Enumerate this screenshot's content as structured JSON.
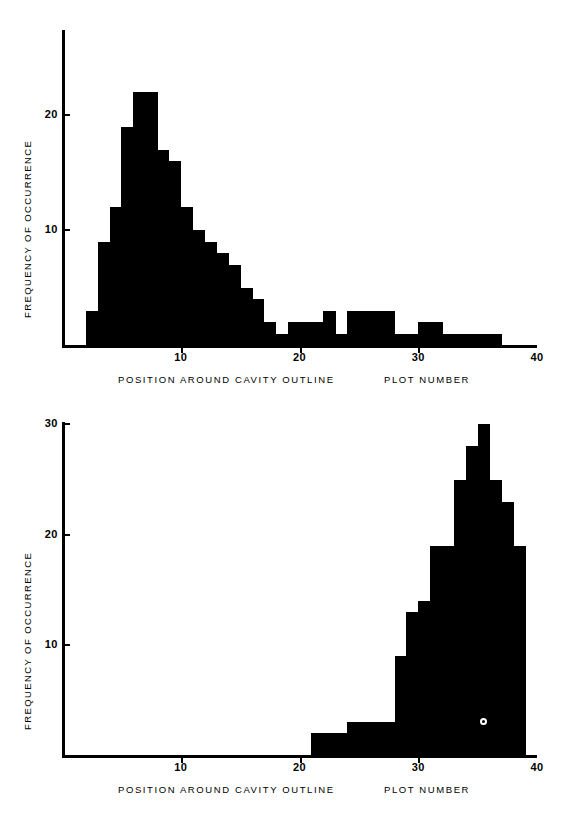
{
  "figure": {
    "background": "#ffffff",
    "ink_color": "#000000"
  },
  "panels": [
    {
      "id": "top",
      "y_axis_title": "FREQUENCY OF OCCURRENCE",
      "x_axis_title_left": "POSITION AROUND CAVITY OUTLINE",
      "x_axis_title_right": "PLOT NUMBER",
      "y_ticks": [
        "10",
        "20"
      ],
      "x_ticks": [
        "10",
        "20",
        "30",
        "40"
      ]
    },
    {
      "id": "bottom",
      "y_axis_title": "FREQUENCY OF OCCURRENCE",
      "x_axis_title_left": "POSITION AROUND CAVITY OUTLINE",
      "x_axis_title_right": "PLOT NUMBER",
      "y_ticks": [
        "10",
        "20",
        "30"
      ],
      "x_ticks": [
        "10",
        "20",
        "30",
        "40"
      ],
      "marker_label": "O"
    }
  ],
  "chart_data": [
    {
      "type": "bar",
      "id": "top-histogram",
      "title": "",
      "xlabel": "POSITION AROUND CAVITY OUTLINE / PLOT NUMBER",
      "ylabel": "FREQUENCY OF OCCURRENCE",
      "xlim": [
        0,
        40
      ],
      "ylim": [
        0,
        24
      ],
      "xticks": [
        10,
        20,
        30,
        40
      ],
      "yticks": [
        10,
        20
      ],
      "grid": false,
      "legend": "none",
      "bin_width": 1,
      "bin_starts": [
        2,
        3,
        4,
        5,
        6,
        7,
        8,
        9,
        10,
        11,
        12,
        13,
        14,
        15,
        16,
        17,
        18,
        19,
        20,
        21,
        22,
        23,
        24,
        25,
        26,
        27,
        28,
        29,
        30,
        31,
        32,
        33,
        34,
        35,
        36
      ],
      "values": [
        3,
        9,
        12,
        19,
        22,
        22,
        17,
        16,
        12,
        10,
        9,
        8,
        7,
        5,
        4,
        2,
        1,
        2,
        2,
        2,
        3,
        1,
        3,
        3,
        3,
        3,
        1,
        1,
        2,
        2,
        1,
        1,
        1,
        1,
        1
      ]
    },
    {
      "type": "bar",
      "id": "bottom-histogram",
      "title": "",
      "xlabel": "POSITION AROUND CAVITY OUTLINE / PLOT NUMBER",
      "ylabel": "FREQUENCY OF OCCURRENCE",
      "xlim": [
        0,
        40
      ],
      "ylim": [
        0,
        31
      ],
      "xticks": [
        10,
        20,
        30,
        40
      ],
      "yticks": [
        10,
        20,
        30
      ],
      "grid": false,
      "legend": "none",
      "bin_width": 1,
      "bin_starts": [
        21,
        22,
        23,
        24,
        25,
        26,
        27,
        28,
        29,
        30,
        31,
        32,
        33,
        34,
        35,
        36,
        37,
        38
      ],
      "values": [
        2,
        2,
        2,
        3,
        3,
        3,
        3,
        9,
        13,
        14,
        19,
        19,
        25,
        28,
        30,
        25,
        23,
        19
      ],
      "annotations": [
        {
          "label": "O",
          "x": 35.5,
          "y": 3
        }
      ]
    }
  ]
}
